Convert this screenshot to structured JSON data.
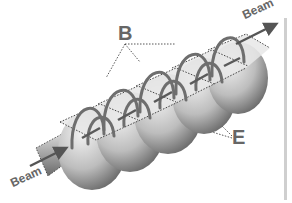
{
  "figure": {
    "labels": {
      "magnetic_field": "B",
      "electric_field": "E",
      "beam_out": "Beam",
      "beam_in": "Beam"
    },
    "cell_count": 5,
    "colors": {
      "field_lines": "#6e6e6e",
      "cell_light": "#e6e6e6",
      "cell_dark": "#6a6a6a",
      "label": "#666666",
      "leader_lines": "#444444",
      "side_bar": "#cfcfcf"
    }
  }
}
